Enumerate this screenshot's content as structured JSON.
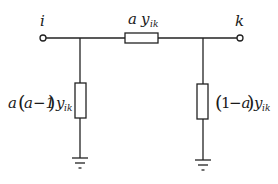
{
  "diagram": {
    "type": "pi-equivalent circuit",
    "nodes": {
      "left": {
        "label": "i"
      },
      "right": {
        "label": "k"
      }
    },
    "series_branch": {
      "coef": "a",
      "symbol": "y",
      "subscript": "ik"
    },
    "left_shunt": {
      "prefix": "a",
      "paren_open": "(",
      "inner": "a−1",
      "paren_close": ")",
      "symbol": "y",
      "subscript": "ik"
    },
    "right_shunt": {
      "paren_open": "(",
      "inner_one": "1",
      "inner_rest": "−a",
      "paren_close": ")",
      "symbol": "y",
      "subscript": "ik"
    },
    "ground_symbols": 2
  }
}
